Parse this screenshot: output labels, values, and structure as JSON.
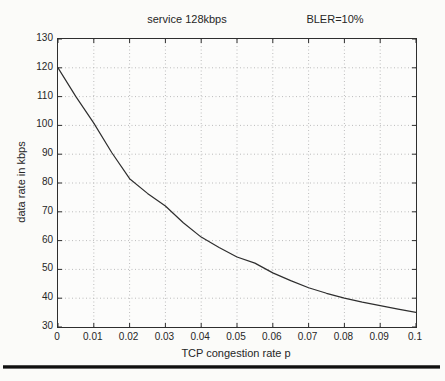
{
  "chart_data": {
    "type": "line",
    "title_left": "service 128kbps",
    "title_right": "BLER=10%",
    "xlabel": "TCP congestion rate p",
    "ylabel": "data rate in kbps",
    "xlim": [
      0,
      0.1
    ],
    "ylim": [
      30,
      130
    ],
    "x_ticks": [
      0,
      0.01,
      0.02,
      0.03,
      0.04,
      0.05,
      0.06,
      0.07,
      0.08,
      0.09,
      0.1
    ],
    "x_tick_labels": [
      "0",
      "0.01",
      "0.02",
      "0.03",
      "0.04",
      "0.05",
      "0.06",
      "0.07",
      "0.08",
      "0.09",
      "0.1"
    ],
    "y_ticks": [
      30,
      40,
      50,
      60,
      70,
      80,
      90,
      100,
      110,
      120,
      130
    ],
    "y_tick_labels": [
      "30",
      "40",
      "50",
      "60",
      "70",
      "80",
      "90",
      "100",
      "110",
      "120",
      "130"
    ],
    "grid": true,
    "legend": null,
    "colors": {
      "line": "#2e2e2e",
      "grid": "#bcbcbc",
      "axis": "#2e2e2e",
      "text": "#262626",
      "page_background": "#fbfbf9"
    },
    "series": [
      {
        "name": "data rate vs congestion",
        "x": [
          0,
          0.005,
          0.01,
          0.015,
          0.02,
          0.025,
          0.03,
          0.035,
          0.04,
          0.045,
          0.05,
          0.055,
          0.06,
          0.065,
          0.07,
          0.075,
          0.08,
          0.085,
          0.09,
          0.095,
          0.1
        ],
        "y": [
          120,
          110,
          100.8,
          90.6,
          81.5,
          76.4,
          72,
          66.2,
          61.2,
          57.6,
          54.3,
          52.2,
          48.8,
          46.1,
          43.6,
          41.7,
          40,
          38.6,
          37.4,
          36.2,
          35.1
        ]
      }
    ]
  },
  "divider": {
    "description": "thick black page rule"
  }
}
